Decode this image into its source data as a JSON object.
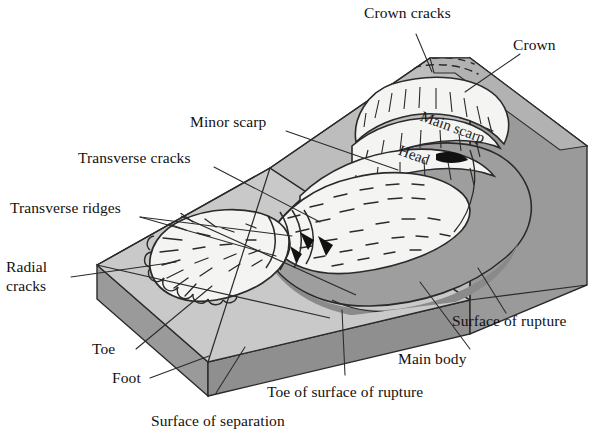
{
  "figure": {
    "type": "block-diagram",
    "background": "#ffffff",
    "palette": {
      "top_surface_light": "#c9c9c9",
      "top_surface_mid": "#bdbdbd",
      "slope_face": "#a8a8a8",
      "side_face": "#9a9a9a",
      "front_face": "#8f8f8f",
      "rupture_surface": "#9e9e9e",
      "rupture_shadow": "#8a8a8a",
      "displaced_mass": "#f4f4f2",
      "outline": "#2a2a2a",
      "arrow_fill": "#111111",
      "text": "#111111"
    }
  },
  "labels": {
    "crown_cracks": "Crown cracks",
    "crown": "Crown",
    "minor_scarp": "Minor scarp",
    "transverse_cracks": "Transverse cracks",
    "transverse_ridges": "Transverse ridges",
    "radial_cracks_line1": "Radial",
    "radial_cracks_line2": "cracks",
    "toe": "Toe",
    "foot": "Foot",
    "surface_of_separation": "Surface of separation",
    "toe_of_surface_of_rupture": "Toe of surface of rupture",
    "main_body": "Main body",
    "surface_of_rupture": "Surface of rupture",
    "main_scarp": "Main scarp",
    "head": "Head"
  }
}
